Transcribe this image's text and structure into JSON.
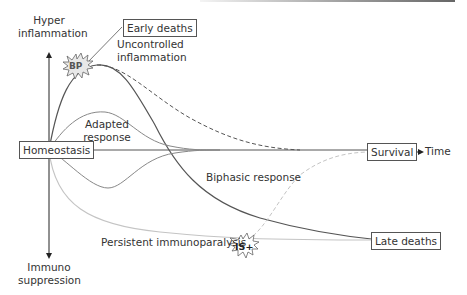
{
  "diagram": {
    "axis": {
      "y_top_label": "Hyper\ninflammation",
      "y_top_line1": "Hyper",
      "y_top_line2": "inflammation",
      "y_bottom_line1": "Immuno",
      "y_bottom_line2": "suppression",
      "x_label": "Time"
    },
    "boxes": {
      "origin": "Homeostasis",
      "early_deaths": "Early deaths",
      "survival": "Survival",
      "late_deaths": "Late deaths"
    },
    "curve_labels": {
      "uncontrolled_line1": "Uncontrolled",
      "uncontrolled_line2": "inflammation",
      "adapted_line1": "Adapted",
      "adapted_line2": "response",
      "biphasic": "Biphasic response",
      "persistent": "Persistent immunoparalysis"
    },
    "markers": {
      "bp": "BP",
      "is_plus": "IS+"
    },
    "colors": {
      "dark_line": "#555555",
      "mid_line": "#8a8a8a",
      "light_line": "#c4c4c4",
      "box_border": "#555555",
      "text": "#333333"
    }
  }
}
